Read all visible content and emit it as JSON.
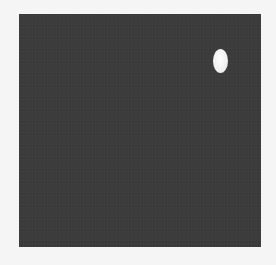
{
  "image": {
    "description": "Dark gray square field with a single small white oval spot in the upper-right region",
    "background_color": "#f5f5f5",
    "field_color": "#3c3c3c",
    "spot_color": "#f2f2f2",
    "field": {
      "left": 19,
      "top": 14,
      "width": 242,
      "height": 233
    },
    "spot": {
      "center_x": 220,
      "center_y": 61,
      "width": 15,
      "height": 24,
      "shape": "ellipse"
    }
  }
}
